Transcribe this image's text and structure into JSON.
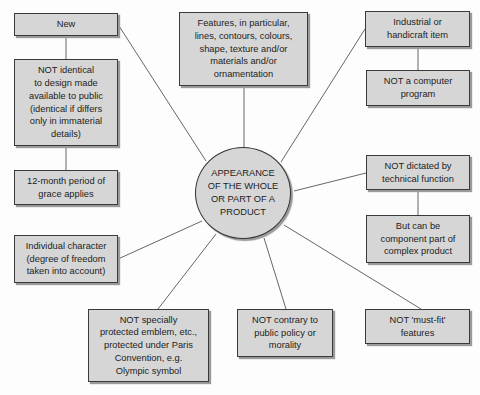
{
  "diagram": {
    "center": {
      "label": "APPEARANCE\nOF THE WHOLE\nOR PART OF A\nPRODUCT"
    },
    "nodes": {
      "new": {
        "label": "New"
      },
      "not_identical": {
        "label": "NOT identical\nto design made\navailable to public\n(identical if differs\nonly in immaterial\ndetails)"
      },
      "grace_period": {
        "label": "12-month period of\ngrace applies"
      },
      "features": {
        "label": "Features, in particular,\nlines, contours, colours,\nshape, texture and/or\nmaterials and/or\nornamentation"
      },
      "industrial": {
        "label": "Industrial or\nhandicraft item"
      },
      "not_computer_program": {
        "label": "NOT a computer\nprogram"
      },
      "not_technical": {
        "label": "NOT dictated by\ntechnical function"
      },
      "component_part": {
        "label": "But can be\ncomponent part of\ncomplex product"
      },
      "individual_character": {
        "label": "Individual character\n(degree of freedom\ntaken into account)"
      },
      "not_emblem": {
        "label": "NOT specially\nprotected emblem, etc.,\nprotected under Paris\nConvention, e.g.\nOlympic symbol"
      },
      "not_public_policy": {
        "label": "NOT contrary to\npublic policy or\nmorality"
      },
      "not_must_fit": {
        "label": "NOT 'must-fit'\nfeatures"
      }
    },
    "edges": [
      [
        "center",
        "new"
      ],
      [
        "new",
        "not_identical"
      ],
      [
        "not_identical",
        "grace_period"
      ],
      [
        "center",
        "features"
      ],
      [
        "center",
        "industrial"
      ],
      [
        "industrial",
        "not_computer_program"
      ],
      [
        "center",
        "not_technical"
      ],
      [
        "not_technical",
        "component_part"
      ],
      [
        "center",
        "individual_character"
      ],
      [
        "center",
        "not_emblem"
      ],
      [
        "center",
        "not_public_policy"
      ],
      [
        "center",
        "not_must_fit"
      ]
    ],
    "colors": {
      "box_fill": "#d6d6d6",
      "border": "#3a3a3a",
      "shadow": "#9a9a9a",
      "line": "#555555",
      "background": "#fdfdfd"
    }
  }
}
